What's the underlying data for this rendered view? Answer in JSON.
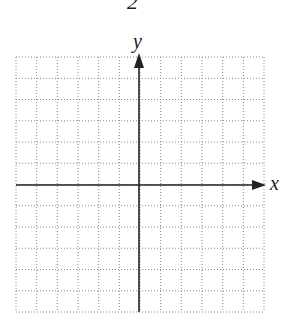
{
  "figure": {
    "number_label": "2",
    "x_axis_label": "x",
    "y_axis_label": "y",
    "grid": {
      "columns": 12,
      "rows": 12,
      "line_style": "dotted",
      "line_color": "#8a8a8a",
      "axis_color": "#222222"
    }
  }
}
